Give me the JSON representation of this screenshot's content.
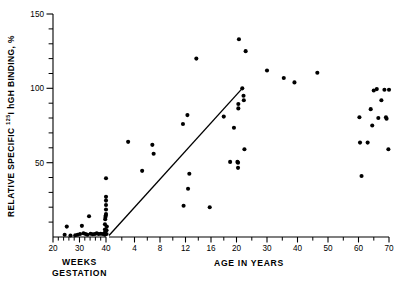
{
  "chart_data": {
    "type": "scatter",
    "title": "",
    "ylabel_parts": {
      "pre": "RELATIVE SPECIFIC ",
      "superscript": "125",
      "post": "I hGH BINDING, %"
    },
    "ylabel": "RELATIVE SPECIFIC 125I hGH BINDING, %",
    "ylim": [
      0,
      150
    ],
    "y_ticks_major": [
      50,
      100,
      150
    ],
    "y_ticks_minor": [
      10,
      20,
      30,
      40,
      60,
      70,
      80,
      90,
      110,
      120,
      130,
      140
    ],
    "y_tick_labels": [
      "50",
      "100",
      "150"
    ],
    "grid": false,
    "legend": false,
    "axis_segments": [
      {
        "name": "gestation",
        "xlabel": "WEEKS GESTATION",
        "xlabel_line1": "WEEKS",
        "xlabel_line2": "GESTATION",
        "units": "weeks",
        "xlim": [
          20,
          41
        ],
        "tick_labels": [
          "20",
          "30",
          "40"
        ],
        "tick_values": [
          20,
          30,
          40
        ],
        "minor_tick_values": [
          22,
          24,
          26,
          28,
          32,
          34,
          36,
          38
        ]
      },
      {
        "name": "age",
        "xlabel": "AGE IN YEARS",
        "units": "years",
        "xlim": [
          0,
          72
        ],
        "tick_labels": [
          "4",
          "8",
          "12",
          "16",
          "20",
          "30",
          "40",
          "50",
          "60",
          "70"
        ],
        "tick_values": [
          4,
          8,
          12,
          16,
          20,
          30,
          40,
          50,
          60,
          70
        ],
        "minor_tick_values": [
          2,
          6,
          10,
          14,
          18,
          25,
          35,
          45,
          55,
          65
        ],
        "scale_break_after": 20,
        "note": "x-axis compresses after age 20"
      }
    ],
    "series": [
      {
        "name": "gestation_points",
        "segment": "gestation",
        "marker": "filled-circle",
        "color": "#000000",
        "points": [
          [
            24.4,
            1.5
          ],
          [
            25.2,
            7.0
          ],
          [
            26.6,
            1.0
          ],
          [
            28.4,
            1.2
          ],
          [
            29.3,
            1.5
          ],
          [
            30.2,
            2.0
          ],
          [
            30.9,
            7.5
          ],
          [
            31.5,
            2.5
          ],
          [
            32.3,
            2.0
          ],
          [
            33.0,
            1.5
          ],
          [
            33.6,
            14.0
          ],
          [
            34.2,
            2.2
          ],
          [
            35.0,
            1.8
          ],
          [
            35.8,
            2.0
          ],
          [
            36.5,
            2.5
          ],
          [
            37.2,
            2.0
          ],
          [
            38.0,
            2.2
          ],
          [
            38.8,
            2.0
          ],
          [
            39.6,
            1.5
          ],
          [
            39.6,
            3.0
          ],
          [
            39.6,
            5.0
          ],
          [
            39.6,
            8.5
          ],
          [
            39.7,
            12.0
          ],
          [
            39.8,
            13.5
          ],
          [
            39.9,
            14.5
          ],
          [
            40.0,
            15.5
          ],
          [
            40.0,
            18.5
          ],
          [
            40.0,
            21.5
          ],
          [
            40.0,
            24.5
          ],
          [
            40.0,
            27.0
          ],
          [
            40.0,
            39.5
          ],
          [
            40.2,
            2.0
          ],
          [
            40.2,
            4.5
          ],
          [
            40.3,
            7.0
          ]
        ]
      },
      {
        "name": "age_points",
        "segment": "age",
        "marker": "filled-circle",
        "color": "#000000",
        "points": [
          [
            3.0,
            64.0
          ],
          [
            5.2,
            44.5
          ],
          [
            6.8,
            62.0
          ],
          [
            7.0,
            56.0
          ],
          [
            11.6,
            76.0
          ],
          [
            11.7,
            21.0
          ],
          [
            12.3,
            82.0
          ],
          [
            12.4,
            32.5
          ],
          [
            12.6,
            42.5
          ],
          [
            13.7,
            120.0
          ],
          [
            15.8,
            20.0
          ],
          [
            18.0,
            81.0
          ],
          [
            19.0,
            50.5
          ],
          [
            19.6,
            73.5
          ],
          [
            20.3,
            50.5
          ],
          [
            20.5,
            50.0
          ],
          [
            20.5,
            46.5
          ],
          [
            20.6,
            86.5
          ],
          [
            20.6,
            89.5
          ],
          [
            20.8,
            133.0
          ],
          [
            21.9,
            100.0
          ],
          [
            22.3,
            95.0
          ],
          [
            22.4,
            92.0
          ],
          [
            22.6,
            59.0
          ],
          [
            23.0,
            125.0
          ],
          [
            30.0,
            112.0
          ],
          [
            35.5,
            107.0
          ],
          [
            39.0,
            104.0
          ],
          [
            46.5,
            110.5
          ],
          [
            60.3,
            80.5
          ],
          [
            60.5,
            63.5
          ],
          [
            61.0,
            41.0
          ],
          [
            63.0,
            63.5
          ],
          [
            64.0,
            86.0
          ],
          [
            64.5,
            75.0
          ],
          [
            65.0,
            98.5
          ],
          [
            66.0,
            99.5
          ],
          [
            66.5,
            80.0
          ],
          [
            67.5,
            92.0
          ],
          [
            68.5,
            99.0
          ],
          [
            69.0,
            80.5
          ],
          [
            69.2,
            79.5
          ],
          [
            69.8,
            59.0
          ],
          [
            70.0,
            99.0
          ]
        ]
      }
    ],
    "trend_line": {
      "name": "regression-line",
      "color": "#000000",
      "segment": "age",
      "start": [
        0.0,
        1.0
      ],
      "end": [
        21.9,
        100.0
      ]
    }
  }
}
